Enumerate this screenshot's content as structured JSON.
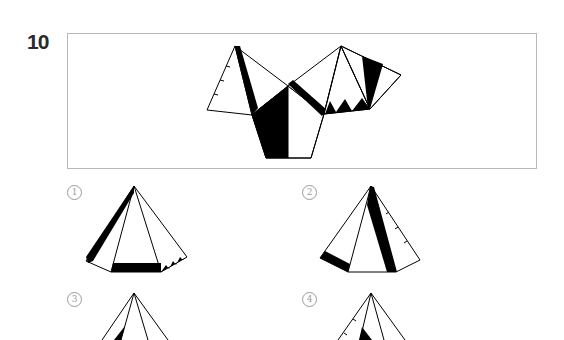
{
  "question": {
    "number": "10"
  },
  "net": {
    "description": "Unfolded net of a pyramid with black stripe, black wedge, zigzag teeth, and tick marks",
    "stroke_color": "#000000",
    "fill_color": "#000000"
  },
  "options": [
    {
      "label": "1",
      "marker": "①"
    },
    {
      "label": "2",
      "marker": "②"
    },
    {
      "label": "3",
      "marker": "③"
    },
    {
      "label": "4",
      "marker": "④"
    }
  ],
  "colors": {
    "frame_border": "#b8b8b8",
    "label_gray": "#9a9a9a",
    "number_text": "#2a2a2a"
  }
}
